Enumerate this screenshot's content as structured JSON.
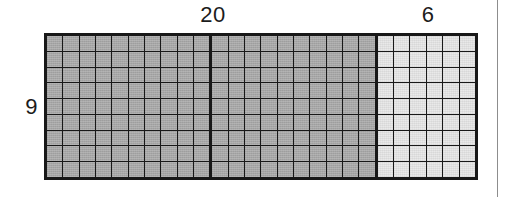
{
  "figure": {
    "background_color": "#ffffff",
    "border_color": "#181818"
  },
  "labels": {
    "top_left_width": "20",
    "top_right_width": "6",
    "left_height": "9"
  },
  "page_rule": {
    "color": "#8d8d8d"
  },
  "chart_data": {
    "type": "table",
    "xlabel": "width (units)",
    "ylabel": "height (units)",
    "rows": 9,
    "total_columns": 26,
    "grid": true,
    "legend": "none",
    "categories": [
      "20",
      "6"
    ],
    "values": [
      180,
      54
    ],
    "blocks": [
      {
        "name": "dark-block-a",
        "columns": 10,
        "rows": 9,
        "fill": "#a6a6a6",
        "shade": "dark",
        "cells": 90
      },
      {
        "name": "dark-block-b",
        "columns": 10,
        "rows": 9,
        "fill": "#a6a6a6",
        "shade": "dark",
        "cells": 90
      },
      {
        "name": "light-block",
        "columns": 6,
        "rows": 9,
        "fill": "#e9e9e9",
        "shade": "light",
        "cells": 54
      }
    ],
    "annotations": [
      {
        "text": "20",
        "position": "top-left-span",
        "describes": "width of shaded (dark) region"
      },
      {
        "text": "6",
        "position": "top-right-span",
        "describes": "width of unshaded (light) region"
      },
      {
        "text": "9",
        "position": "left-middle",
        "describes": "height of rectangle"
      }
    ]
  }
}
